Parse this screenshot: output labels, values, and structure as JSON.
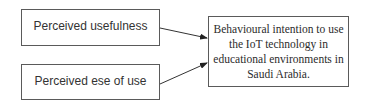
{
  "diagram": {
    "nodes": [
      {
        "id": "perceived-usefulness",
        "label": "Perceived usefulness"
      },
      {
        "id": "perceived-ease-of-use",
        "label": "Perceived ese of use"
      },
      {
        "id": "behavioural-intention",
        "label": "Behavioural intention to use the IoT technology in educational environments in Saudi Arabia."
      }
    ],
    "edges": [
      {
        "from": "perceived-usefulness",
        "to": "behavioural-intention"
      },
      {
        "from": "perceived-ease-of-use",
        "to": "behavioural-intention"
      }
    ],
    "colors": {
      "border": "#5a5a5a",
      "arrow": "#222222",
      "text": "#333333"
    }
  }
}
